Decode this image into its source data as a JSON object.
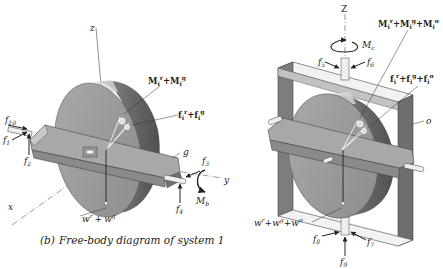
{
  "caption": {
    "prefix": "(b)",
    "text": "Free-body diagram of system 1"
  },
  "left_diagram": {
    "axes": {
      "z": "z",
      "x": "x",
      "y": "y"
    },
    "frame_label": "g",
    "forces": {
      "f10": "f",
      "f10_sub": "10",
      "f1": "f",
      "f1_sub": "1",
      "f2": "f",
      "f2_sub": "2",
      "f3": "f",
      "f3_sub": "3",
      "f4": "f",
      "f4_sub": "4"
    },
    "moment": {
      "symbol": "M",
      "sub": "b"
    },
    "inertia_moment": {
      "a": "M",
      "a_sub": "i",
      "a_sup": "r",
      "plus": "+",
      "b": "M",
      "b_sub": "i",
      "b_sup": "g"
    },
    "inertia_force": {
      "a": "f",
      "a_sub": "i",
      "a_sup": "r",
      "plus": "+",
      "b": "f",
      "b_sub": "i",
      "b_sup": "g"
    },
    "weight": {
      "a": "w",
      "a_sup": "r",
      "plus": "+",
      "b": "w",
      "b_sup": "g"
    }
  },
  "right_diagram": {
    "axes": {
      "z": "Z"
    },
    "frame_label": "o",
    "forces": {
      "f5": "f",
      "f5_sub": "5",
      "f6": "f",
      "f6_sub": "6",
      "f7": "f",
      "f7_sub": "7",
      "f8": "f",
      "f8_sub": "8",
      "f9": "f",
      "f9_sub": "9"
    },
    "moment": {
      "symbol": "M",
      "sub": "c"
    },
    "inertia_moment": {
      "a": "M",
      "a_sub": "i",
      "a_sup": "r",
      "p1": "+",
      "b": "M",
      "b_sub": "i",
      "b_sup": "g",
      "p2": "+",
      "c": "M",
      "c_sub": "i",
      "c_sup": "o"
    },
    "inertia_force": {
      "a": "f",
      "a_sub": "i",
      "a_sup": "r",
      "p1": "+",
      "b": "f",
      "b_sub": "i",
      "b_sup": "g",
      "p2": "+",
      "c": "f",
      "c_sub": "i",
      "c_sup": "o"
    },
    "weight": {
      "a": "w",
      "a_sup": "r",
      "p1": "+",
      "b": "w",
      "b_sup": "g",
      "p2": "+",
      "c": "w",
      "c_sup": "o"
    }
  },
  "colors": {
    "disk_face": "#9a9a9a",
    "disk_rim": "#6e6e6e",
    "frame_light": "#b9b9b9",
    "frame_dark": "#7a7a7a",
    "line": "#222222"
  }
}
